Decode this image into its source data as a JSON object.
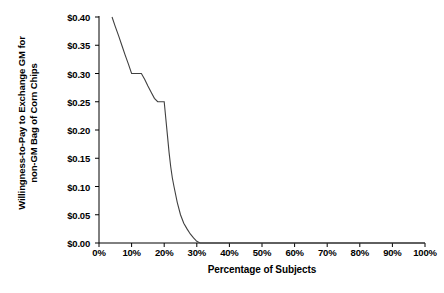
{
  "chart_data": {
    "type": "line",
    "title": "",
    "xlabel": "Percentage of Subjects",
    "ylabel_line1": "Willingness-to-Pay to Exchange GM for",
    "ylabel_line2": "non-GM Bag of Corn Chips",
    "xlim": [
      0,
      100
    ],
    "ylim": [
      0,
      0.4
    ],
    "grid": false,
    "legend": "none",
    "xticks": [
      "0%",
      "10%",
      "20%",
      "30%",
      "40%",
      "50%",
      "60%",
      "70%",
      "80%",
      "90%",
      "100%"
    ],
    "xtick_values": [
      0,
      10,
      20,
      30,
      40,
      50,
      60,
      70,
      80,
      90,
      100
    ],
    "yticks": [
      "$0.00",
      "$0.05",
      "$0.10",
      "$0.15",
      "$0.20",
      "$0.25",
      "$0.30",
      "$0.35",
      "$0.40"
    ],
    "ytick_values": [
      0.0,
      0.05,
      0.1,
      0.15,
      0.2,
      0.25,
      0.3,
      0.35,
      0.4
    ],
    "series": [
      {
        "name": "Willingness-to-Pay",
        "x": [
          4.0,
          5.0,
          6.0,
          7.0,
          8.0,
          9.0,
          10.0,
          11.0,
          12.0,
          13.0,
          14.0,
          15.0,
          16.0,
          17.0,
          18.0,
          19.0,
          20.0,
          20.5,
          21.0,
          21.5,
          22.0,
          22.5,
          23.0,
          24.0,
          25.0,
          26.0,
          27.0,
          28.0,
          29.0,
          30.0,
          31.0,
          40.0,
          50.0,
          60.0,
          70.0,
          80.0,
          90.0,
          100.0
        ],
        "y": [
          0.4,
          0.383,
          0.367,
          0.35,
          0.333,
          0.317,
          0.3,
          0.3,
          0.3,
          0.3,
          0.29,
          0.278,
          0.267,
          0.256,
          0.25,
          0.25,
          0.25,
          0.22,
          0.19,
          0.16,
          0.135,
          0.115,
          0.1,
          0.072,
          0.05,
          0.035,
          0.025,
          0.016,
          0.009,
          0.003,
          0.0,
          0.0,
          0.0,
          0.0,
          0.0,
          0.0,
          0.0,
          0.0
        ]
      }
    ],
    "line_color": "#404040"
  }
}
